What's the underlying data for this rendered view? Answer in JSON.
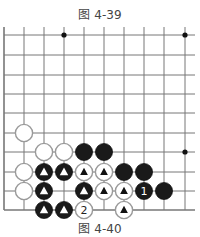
{
  "captions": {
    "top": "图 4-39",
    "bottom": "图 4-40"
  },
  "colors": {
    "line": "#777777",
    "black_stone": "#1a1a1a",
    "white_stone_fill": "#ffffff",
    "white_stone_edge": "#9a9a9a"
  },
  "board": {
    "cols_x": [
      4,
      24,
      44,
      64,
      84,
      104,
      124,
      144,
      164,
      185
    ],
    "rows_y": [
      35,
      55,
      75,
      94,
      113,
      133,
      152,
      172,
      191,
      210
    ],
    "right_extent": 195,
    "top_extent": 27,
    "star_points": [
      [
        3,
        0
      ],
      [
        9,
        0
      ],
      [
        9,
        6
      ]
    ],
    "stones": [
      {
        "c": 1,
        "r": 5,
        "color": "white",
        "mark": ""
      },
      {
        "c": 2,
        "r": 6,
        "color": "white",
        "mark": ""
      },
      {
        "c": 3,
        "r": 6,
        "color": "white",
        "mark": ""
      },
      {
        "c": 4,
        "r": 6,
        "color": "black",
        "mark": ""
      },
      {
        "c": 5,
        "r": 6,
        "color": "black",
        "mark": ""
      },
      {
        "c": 1,
        "r": 7,
        "color": "white",
        "mark": ""
      },
      {
        "c": 2,
        "r": 7,
        "color": "black",
        "mark": "triangle"
      },
      {
        "c": 3,
        "r": 7,
        "color": "black",
        "mark": "triangle"
      },
      {
        "c": 4,
        "r": 7,
        "color": "white",
        "mark": "triangle"
      },
      {
        "c": 5,
        "r": 7,
        "color": "white",
        "mark": "triangle"
      },
      {
        "c": 6,
        "r": 7,
        "color": "black",
        "mark": ""
      },
      {
        "c": 7,
        "r": 7,
        "color": "black",
        "mark": ""
      },
      {
        "c": 1,
        "r": 8,
        "color": "white",
        "mark": ""
      },
      {
        "c": 2,
        "r": 8,
        "color": "black",
        "mark": "triangle"
      },
      {
        "c": 4,
        "r": 8,
        "color": "black",
        "mark": "triangle"
      },
      {
        "c": 5,
        "r": 8,
        "color": "white",
        "mark": "triangle"
      },
      {
        "c": 6,
        "r": 8,
        "color": "white",
        "mark": "triangle"
      },
      {
        "c": 7,
        "r": 8,
        "color": "black",
        "mark": "1"
      },
      {
        "c": 8,
        "r": 8,
        "color": "black",
        "mark": ""
      },
      {
        "c": 2,
        "r": 9,
        "color": "black",
        "mark": "triangle"
      },
      {
        "c": 3,
        "r": 9,
        "color": "black",
        "mark": "triangle"
      },
      {
        "c": 4,
        "r": 9,
        "color": "white",
        "mark": "2"
      },
      {
        "c": 6,
        "r": 9,
        "color": "white",
        "mark": "triangle"
      }
    ]
  }
}
